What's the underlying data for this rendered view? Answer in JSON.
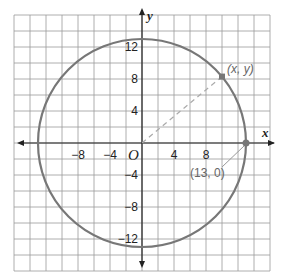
{
  "chart_data": {
    "type": "diagram",
    "title": "",
    "xlabel": "x",
    "ylabel": "y",
    "origin_label": "O",
    "grid": true,
    "grid_step": 2,
    "xlim": [
      -16,
      16
    ],
    "ylim": [
      -16,
      16
    ],
    "x_ticks": [
      {
        "value": -8,
        "label": "−8"
      },
      {
        "value": -4,
        "label": "−4"
      },
      {
        "value": 4,
        "label": "4"
      },
      {
        "value": 8,
        "label": "8"
      }
    ],
    "y_ticks": [
      {
        "value": 12,
        "label": "12"
      },
      {
        "value": 8,
        "label": "8"
      },
      {
        "value": 4,
        "label": "4"
      },
      {
        "value": -4,
        "label": "−4"
      },
      {
        "value": -8,
        "label": "−8"
      },
      {
        "value": -12,
        "label": "−12"
      }
    ],
    "circle": {
      "center": [
        0,
        0
      ],
      "radius": 13,
      "color": "#777777"
    },
    "points": [
      {
        "name": "general-point",
        "x": 10,
        "y": 8.3,
        "label": "(x, y)"
      },
      {
        "name": "x-intercept-point",
        "x": 13,
        "y": 0,
        "label": "(13, 0)"
      }
    ],
    "dashed_segment": {
      "from": [
        0,
        0
      ],
      "to": [
        10,
        8.3
      ]
    }
  }
}
